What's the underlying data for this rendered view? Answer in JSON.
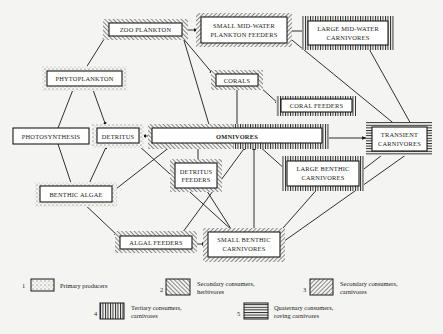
{
  "colors": {
    "background": "#f4f4f2",
    "ink": "#1a1a1a",
    "box_fill": "#ffffff"
  },
  "nodes": {
    "zoo_plankton": {
      "label": "ZOO  PLANKTON",
      "category": 2
    },
    "small_midwater": {
      "line1": "SMALL MID-WATER",
      "line2": "PLANKTON FEEDERS",
      "category": 3
    },
    "large_midwater": {
      "line1": "LARGE MID-WATER",
      "line2": "CARNIVORES",
      "category": 4
    },
    "phytoplankton": {
      "label": "PHYTOPLANKTON",
      "category": 1
    },
    "corals": {
      "label": "CORALS",
      "category": 2
    },
    "coral_feeders": {
      "label": "CORAL FEEDERS",
      "category": 4
    },
    "photosynthesis": {
      "label": "PHOTOSYNTHESIS",
      "category": 0
    },
    "detritus": {
      "label": "DETRITUS",
      "category": 1
    },
    "omnivores": {
      "label": "OMNIVORES",
      "category": "2/4"
    },
    "transient": {
      "line1": "TRANSIENT",
      "line2": "CARNIVORES",
      "category": 5
    },
    "detritus_feeders": {
      "line1": "DETRITUS",
      "line2": "FEEDERS",
      "category": 2
    },
    "large_benthic": {
      "line1": "LARGE BENTHIC",
      "line2": "CARNIVORES",
      "category": 4
    },
    "benthic_algae": {
      "label": "BENTHIC ALGAE",
      "category": 1
    },
    "algal_feeders": {
      "label": "ALGAL FEEDERS",
      "category": 2
    },
    "small_benthic": {
      "line1": "SMALL BENTHIC",
      "line2": "CARNIVORES",
      "category": 3
    }
  },
  "edges": [
    [
      "photosynthesis",
      "phytoplankton"
    ],
    [
      "photosynthesis",
      "benthic_algae"
    ],
    [
      "phytoplankton",
      "zoo_plankton"
    ],
    [
      "phytoplankton",
      "detritus"
    ],
    [
      "benthic_algae",
      "detritus"
    ],
    [
      "benthic_algae",
      "omnivores"
    ],
    [
      "benthic_algae",
      "algal_feeders"
    ],
    [
      "zoo_plankton",
      "small_midwater"
    ],
    [
      "zoo_plankton",
      "corals"
    ],
    [
      "zoo_plankton",
      "omnivores"
    ],
    [
      "small_midwater",
      "large_midwater"
    ],
    [
      "small_midwater",
      "transient"
    ],
    [
      "large_midwater",
      "transient"
    ],
    [
      "corals",
      "coral_feeders"
    ],
    [
      "corals",
      "omnivores"
    ],
    [
      "omnivores",
      "detritus"
    ],
    [
      "omnivores",
      "transient"
    ],
    [
      "omnivores",
      "large_benthic"
    ],
    [
      "detritus_feeders",
      "omnivores"
    ],
    [
      "detritus",
      "small_benthic"
    ],
    [
      "algal_feeders",
      "small_benthic"
    ],
    [
      "algal_feeders",
      "omnivores"
    ],
    [
      "detritus_feeders",
      "small_benthic"
    ],
    [
      "small_benthic",
      "omnivores"
    ],
    [
      "small_benthic",
      "large_benthic"
    ],
    [
      "small_benthic",
      "transient"
    ],
    [
      "large_benthic",
      "transient"
    ]
  ],
  "legend": [
    {
      "num": "1",
      "line1": "Primary producers",
      "line2": ""
    },
    {
      "num": "2",
      "line1": "Secondary consumers,",
      "line2": "herbivores"
    },
    {
      "num": "3",
      "line1": "Secondary consumers,",
      "line2": "carnivores"
    },
    {
      "num": "4",
      "line1": "Tertiary consumers,",
      "line2": "carnivores"
    },
    {
      "num": "5",
      "line1": "Quaternary consumers,",
      "line2": "roving carnivores"
    }
  ]
}
